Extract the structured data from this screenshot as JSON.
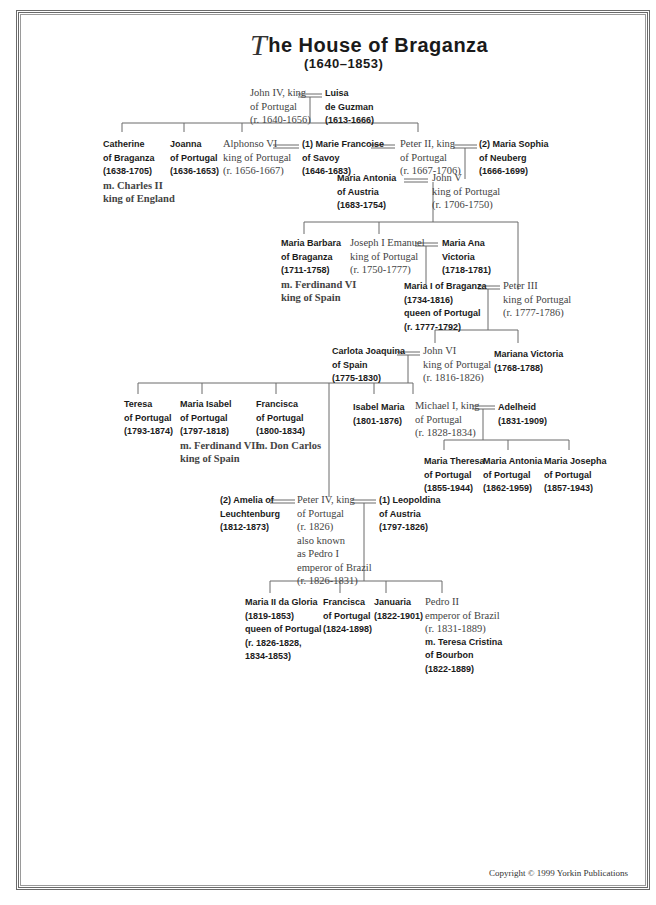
{
  "title": {
    "drop_cap": "T",
    "text": "he House of Braganza",
    "subtitle": "(1640–1853)"
  },
  "people": {
    "john4": {
      "lines": [
        "John IV, king",
        "of Portugal",
        "(r. 1640-1656)"
      ],
      "style": "ruler"
    },
    "luisa": {
      "lines": [
        "Luisa",
        "de Guzman",
        "(1613-1666)"
      ],
      "style": "consort"
    },
    "catherine": {
      "lines": [
        "Catherine",
        "of Braganza",
        "(1638-1705)"
      ],
      "extra": [
        "m. Charles II",
        "king of England"
      ],
      "style": "consort"
    },
    "joanna": {
      "lines": [
        "Joanna",
        "of Portugal",
        "(1636-1653)"
      ],
      "style": "consort"
    },
    "alphonso6": {
      "lines": [
        "Alphonso VI",
        "king of Portugal",
        "(r. 1656-1667)"
      ],
      "style": "ruler"
    },
    "mariefr": {
      "lines": [
        "(1) Marie Francoise",
        "of Savoy",
        "(1646-1683)"
      ],
      "style": "consort"
    },
    "peter2": {
      "lines": [
        "Peter II, king",
        "of Portugal",
        "(r. 1667-1706)"
      ],
      "style": "ruler"
    },
    "mariasoph": {
      "lines": [
        "(2) Maria Sophia",
        "of Neuberg",
        "(1666-1699)"
      ],
      "style": "consort"
    },
    "mariaant": {
      "lines": [
        "Maria Antonia",
        "of Austria",
        "(1683-1754)"
      ],
      "style": "consort"
    },
    "john5": {
      "lines": [
        "John V",
        "king of Portugal",
        "(r. 1706-1750)"
      ],
      "style": "ruler"
    },
    "mariabarb": {
      "lines": [
        "Maria Barbara",
        "of Braganza",
        "(1711-1758)"
      ],
      "extra": [
        "m. Ferdinand VI",
        "king of Spain"
      ],
      "style": "consort"
    },
    "joseph1": {
      "lines": [
        "Joseph I Emanuel",
        "king of Portugal",
        "(r. 1750-1777)"
      ],
      "style": "ruler"
    },
    "mariaana": {
      "lines": [
        "Maria Ana",
        "Victoria",
        "(1718-1781)"
      ],
      "style": "consort"
    },
    "maria1": {
      "lines": [
        "Maria I of Braganza",
        "(1734-1816)",
        "queen of Portugal",
        "(r. 1777-1792)"
      ],
      "style": "consort"
    },
    "peter3": {
      "lines": [
        "Peter III",
        "king of Portugal",
        "(r. 1777-1786)"
      ],
      "style": "ruler"
    },
    "carlota": {
      "lines": [
        "Carlota Joaquina",
        "of Spain",
        "(1775-1830)"
      ],
      "style": "consort"
    },
    "john6": {
      "lines": [
        "John VI",
        "king of Portugal",
        "(r. 1816-1826)"
      ],
      "style": "ruler"
    },
    "marianav": {
      "lines": [
        "Mariana Victoria",
        "(1768-1788)"
      ],
      "style": "consort"
    },
    "teresa": {
      "lines": [
        "Teresa",
        "of Portugal",
        "(1793-1874)"
      ],
      "style": "consort"
    },
    "mariaisab": {
      "lines": [
        "Maria Isabel",
        "of Portugal",
        "(1797-1818)"
      ],
      "extra": [
        "m. Ferdinand VII",
        "king of Spain"
      ],
      "style": "consort"
    },
    "francisca1": {
      "lines": [
        "Francisca",
        "of Portugal",
        "(1800-1834)"
      ],
      "extra": [
        "m. Don Carlos"
      ],
      "style": "consort"
    },
    "isabelmaria": {
      "lines": [
        "Isabel Maria",
        "(1801-1876)"
      ],
      "style": "consort"
    },
    "michael1": {
      "lines": [
        "Michael I, king",
        "of Portugal",
        "(r. 1828-1834)"
      ],
      "style": "ruler"
    },
    "adelheid": {
      "lines": [
        "Adelheid",
        "(1831-1909)"
      ],
      "style": "consort"
    },
    "mtheresa": {
      "lines": [
        "Maria Theresa",
        "of Portugal",
        "(1855-1944)"
      ],
      "style": "consort"
    },
    "mantonia": {
      "lines": [
        "Maria Antonia",
        "of Portugal",
        "(1862-1959)"
      ],
      "style": "consort"
    },
    "mjosepha": {
      "lines": [
        "Maria Josepha",
        "of Portugal",
        "(1857-1943)"
      ],
      "style": "consort"
    },
    "amelia": {
      "lines": [
        "(2) Amelia of",
        "Leuchtenburg",
        "(1812-1873)"
      ],
      "style": "consort"
    },
    "peter4": {
      "lines": [
        "Peter IV, king",
        "of Portugal",
        "(r. 1826)",
        "also known",
        "as Pedro I",
        "emperor of Brazil",
        "(r. 1826-1831)"
      ],
      "style": "ruler"
    },
    "leopoldina": {
      "lines": [
        "(1) Leopoldina",
        "of Austria",
        "(1797-1826)"
      ],
      "style": "consort"
    },
    "maria2": {
      "lines": [
        "Maria II da Gloria",
        "(1819-1853)",
        "queen of Portugal",
        "(r. 1826-1828,",
        "1834-1853)"
      ],
      "style": "consort"
    },
    "francisca2": {
      "lines": [
        "Francisca",
        "of Portugal",
        "(1824-1898)"
      ],
      "style": "consort"
    },
    "januaria": {
      "lines": [
        "Januaria",
        "(1822-1901)"
      ],
      "style": "consort"
    },
    "pedro2": {
      "lines": [
        "Pedro II",
        "emperor of Brazil",
        "(r. 1831-1889)"
      ],
      "extra_bold": [
        "m. Teresa Cristina",
        "of Bourbon",
        "(1822-1889)"
      ],
      "style": "ruler"
    }
  },
  "footer": {
    "copyright": "Copyright © 1999 Yorkin Publications"
  },
  "colors": {
    "line": "#6a6a6a",
    "bold_text": "#1a1a1a",
    "serif_text": "#444444"
  }
}
